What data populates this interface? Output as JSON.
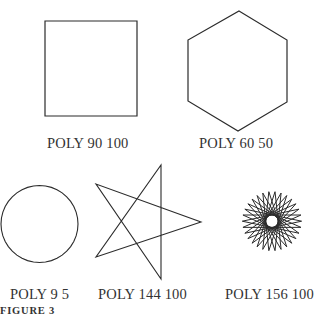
{
  "figure": {
    "caption": "FIGURE 3",
    "stroke_color": "#2b2b2b",
    "background": "#ffffff"
  },
  "panels": [
    {
      "id": "poly-90-100",
      "label": "POLY 90 100",
      "angle": 90,
      "side": 100,
      "shape": "square"
    },
    {
      "id": "poly-60-50",
      "label": "POLY 60 50",
      "angle": 60,
      "side": 50,
      "shape": "hexagon"
    },
    {
      "id": "poly-9-5",
      "label": "POLY 9 5",
      "angle": 9,
      "side": 5,
      "shape": "circle-like 40-gon"
    },
    {
      "id": "poly-144-100",
      "label": "POLY 144 100",
      "angle": 144,
      "side": 100,
      "shape": "five-pointed star"
    },
    {
      "id": "poly-156-100",
      "label": "POLY 156 100",
      "angle": 156,
      "side": 100,
      "shape": "fifteen-pointed star"
    }
  ]
}
